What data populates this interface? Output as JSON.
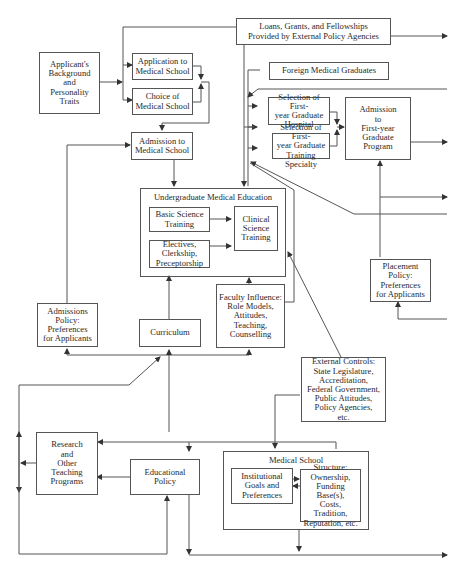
{
  "diagram": {
    "title": "",
    "nodes": {
      "applicant_background": {
        "label": "Applicant's\nBackground\nand\nPersonality\nTraits"
      },
      "application_to_med_school": {
        "label": "Application to\nMedical School"
      },
      "choice_of_med_school": {
        "label": "Choice of\nMedical School"
      },
      "admission_to_med_school": {
        "label": "Admission to\nMedical School"
      },
      "loans_grants": {
        "label": "Loans, Grants, and Fellowships\nProvided by External Policy Agencies"
      },
      "foreign_med_grads": {
        "label": "Foreign Medical Graduates"
      },
      "selection_hospital": {
        "label": "Selection of First-\nyear Graduate\nHospital"
      },
      "selection_specialty": {
        "label": "Selection of First-\nyear Graduate\nTraining Specialty"
      },
      "admission_first_year": {
        "label": "Admission\nto\nFirst-year\nGraduate\nProgram"
      },
      "undergrad_med_ed": {
        "label": "Undergraduate Medical Education"
      },
      "basic_science": {
        "label": "Basic Science\nTraining"
      },
      "clinical_science": {
        "label": "Clinical\nScience\nTraining"
      },
      "electives": {
        "label": "Electives,\nClerkship,\nPreceptorship"
      },
      "placement_policy": {
        "label": "Placement\nPolicy:\nPreferences\nfor Applicants"
      },
      "admissions_policy": {
        "label": "Admissions\nPolicy:\nPreferences\nfor Applicants"
      },
      "curriculum": {
        "label": "Curriculum"
      },
      "faculty_influence": {
        "label": "Faculty Influence:\nRole Models,\nAttitudes,\nTeaching,\nCounselling"
      },
      "external_controls": {
        "label": "External Controls:\nState Legislature,\nAccreditation,\nFederal Government,\nPublic Attitudes,\nPolicy Agencies,\netc."
      },
      "research_programs": {
        "label": "Research\nand\nOther\nTeaching\nPrograms"
      },
      "educational_policy": {
        "label": "Educational\nPolicy"
      },
      "medical_school": {
        "label": "Medical School"
      },
      "institutional_goals": {
        "label": "Institutional\nGoals and\nPreferences"
      },
      "structure": {
        "label": "Structure:\nOwnership,\nFunding Base(s),\nCosts, Tradition,\nReputation, etc."
      }
    },
    "colors": {
      "line": "#555555",
      "text": "#2a2a2a",
      "background": "#ffffff"
    }
  }
}
